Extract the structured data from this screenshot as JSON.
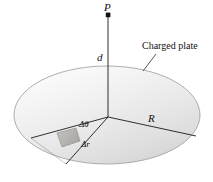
{
  "figure": {
    "background_color": "#ffffff",
    "line_color": "#1a1a1a",
    "disk_fill_light": "#fbfbfb",
    "disk_fill_dark": "#d8d8d8",
    "patch_fill": "#b9b5b2",
    "width": 213,
    "height": 182
  },
  "labels": {
    "point_p": "P",
    "distance_d": "d",
    "radius_r": "R",
    "plate": "Charged plate",
    "delta_theta": "Δθ",
    "delta_r": "Δr"
  },
  "geometry": {
    "disk_center": {
      "x": 107,
      "y": 115
    },
    "disk_rx": 93,
    "disk_ry": 49,
    "apex_point": {
      "x": 108,
      "y": 117
    },
    "point_p_marker": {
      "x": 108,
      "y": 15
    },
    "axis_top": {
      "x": 108,
      "y": 17
    },
    "axis_bottom": {
      "x": 108,
      "y": 117
    },
    "radius_line_r_end": {
      "x": 196,
      "y": 136
    },
    "sector_edge_a_end": {
      "x": 31,
      "y": 138
    },
    "sector_edge_b_end": {
      "x": 65,
      "y": 163
    },
    "leader_line_start": {
      "x": 155,
      "y": 55
    },
    "leader_line_end": {
      "x": 144,
      "y": 70
    }
  }
}
